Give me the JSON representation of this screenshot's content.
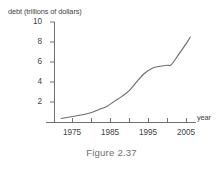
{
  "caption": "Figure 2.37",
  "chart_data": {
    "type": "line",
    "title": "",
    "xlabel": "year",
    "ylabel": "debt (trillions of dollars)",
    "xlim": [
      1972,
      2007
    ],
    "ylim": [
      0,
      10
    ],
    "grid": false,
    "legend": "none",
    "y_ticks": [
      2,
      4,
      6,
      8,
      10
    ],
    "y_tick_labels": [
      "2",
      "4",
      "6",
      "8",
      "10"
    ],
    "x_ticks": [
      1975,
      1980,
      1985,
      1990,
      1995,
      2000,
      2005
    ],
    "x_tick_labels": [
      "1975",
      "",
      "1985",
      "",
      "1995",
      "",
      "2005"
    ],
    "x_labeled_ticks": [
      "1975",
      "1985",
      "1995",
      "2005"
    ],
    "series": [
      {
        "name": "national debt",
        "x": [
          1972,
          1975,
          1978,
          1980,
          1982,
          1984,
          1986,
          1988,
          1990,
          1992,
          1994,
          1996,
          1998,
          2000,
          2001,
          2003,
          2005,
          2006
        ],
        "values": [
          0.4,
          0.6,
          0.8,
          1.0,
          1.3,
          1.6,
          2.1,
          2.6,
          3.2,
          4.1,
          4.9,
          5.4,
          5.6,
          5.7,
          5.75,
          6.8,
          7.9,
          8.5
        ]
      }
    ]
  },
  "axis_titles": {
    "y": "debt (trillions of dollars)",
    "x": "year"
  }
}
